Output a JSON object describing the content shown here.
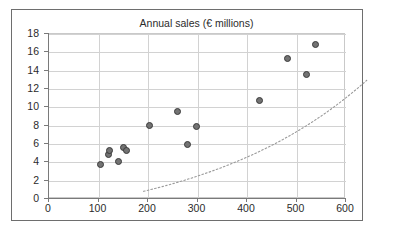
{
  "chart_data": {
    "type": "scatter",
    "title": "Annual sales (€ millions)",
    "xlabel": "",
    "ylabel": "",
    "xlim": [
      0,
      600
    ],
    "ylim": [
      0,
      18
    ],
    "xticks": [
      0,
      100,
      200,
      300,
      400,
      500,
      600
    ],
    "yticks": [
      0,
      2,
      4,
      6,
      8,
      10,
      12,
      14,
      16,
      18
    ],
    "grid": true,
    "legend": false,
    "marker_fill": "#737373",
    "marker_edge": "#3a3a3a",
    "trendline": {
      "style": "dotted",
      "color": "#9a9a9a",
      "type": "exponential"
    },
    "points": [
      {
        "x": 104,
        "y": 3.8
      },
      {
        "x": 121,
        "y": 4.9
      },
      {
        "x": 122,
        "y": 5.3
      },
      {
        "x": 140,
        "y": 4.1
      },
      {
        "x": 151,
        "y": 5.6
      },
      {
        "x": 157,
        "y": 5.3
      },
      {
        "x": 204,
        "y": 8.0
      },
      {
        "x": 259,
        "y": 9.5
      },
      {
        "x": 279,
        "y": 5.9
      },
      {
        "x": 297,
        "y": 7.9
      },
      {
        "x": 425,
        "y": 10.8
      },
      {
        "x": 482,
        "y": 15.3
      },
      {
        "x": 520,
        "y": 13.6
      },
      {
        "x": 539,
        "y": 16.9
      }
    ]
  },
  "ticklabels": {
    "y": [
      "18",
      "16",
      "14",
      "12",
      "10",
      "8",
      "6",
      "4",
      "2",
      "0"
    ],
    "x": [
      "0",
      "100",
      "200",
      "300",
      "400",
      "500",
      "600"
    ]
  }
}
